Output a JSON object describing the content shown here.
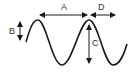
{
  "diagram": {
    "type": "wave",
    "labels": {
      "A": "A",
      "B": "B",
      "C": "C",
      "D": "D"
    },
    "colors": {
      "stroke": "#1a1a1a",
      "background": "#ffffff"
    }
  }
}
